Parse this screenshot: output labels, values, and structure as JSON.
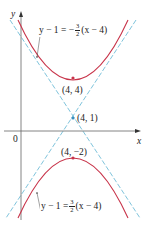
{
  "figure": {
    "type": "hyperbola-graph",
    "axes": {
      "x_label": "x",
      "y_label": "y",
      "origin_label": "0"
    },
    "center": {
      "label": "(4, 1)"
    },
    "vertices": [
      {
        "label": "(4, 4)"
      },
      {
        "label": "(4, −2)"
      }
    ],
    "asymptotes": [
      {
        "equation_lhs": "y − 1 = −",
        "frac_num": "3",
        "frac_den": "2",
        "equation_rhs": "(x − 4)"
      },
      {
        "equation_lhs": "y − 1 = ",
        "frac_num": "3",
        "frac_den": "2",
        "equation_rhs": "(x − 4)"
      }
    ],
    "colors": {
      "hyperbola": "#c8344a",
      "asymptote": "#7fc4dc",
      "axis": "#555555",
      "vertex_dot": "#c8344a",
      "center_dot": "#3a8fc0"
    }
  }
}
